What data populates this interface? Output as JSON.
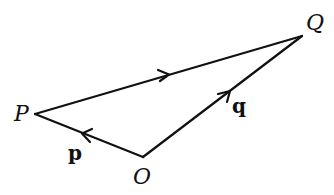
{
  "diagram": {
    "type": "vector-triangle",
    "points": {
      "P": {
        "label": "P",
        "x": 35,
        "y": 114
      },
      "Q": {
        "label": "Q",
        "x": 302,
        "y": 36
      },
      "O": {
        "label": "O",
        "x": 143,
        "y": 157
      }
    },
    "vectors": {
      "p": {
        "label": "p",
        "from": "O",
        "to": "P"
      },
      "q": {
        "label": "q",
        "from": "O",
        "to": "Q"
      },
      "PQ": {
        "label": "",
        "from": "P",
        "to": "Q"
      }
    },
    "stroke_color": "#111111",
    "background": "#ffffff"
  }
}
